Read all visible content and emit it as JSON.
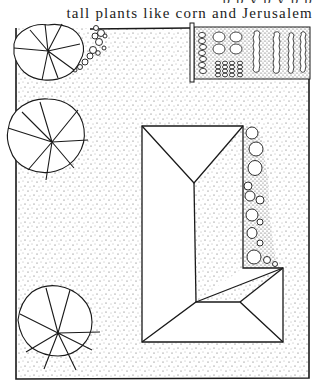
{
  "page": {
    "caption_cut": "p p y p y p p",
    "caption": "tall plants like corn and Jerusalem"
  },
  "illustration": {
    "type": "garden-plan",
    "elements": [
      "tree-top-left",
      "tree-middle-left",
      "tree-bottom-left",
      "shrub-cluster-top",
      "vegetable-beds",
      "fence-post",
      "house-roof",
      "shrub-border-east"
    ],
    "colors": {
      "ink": "#1a1a1a",
      "paper": "#ffffff",
      "stipple": "#555555"
    }
  }
}
